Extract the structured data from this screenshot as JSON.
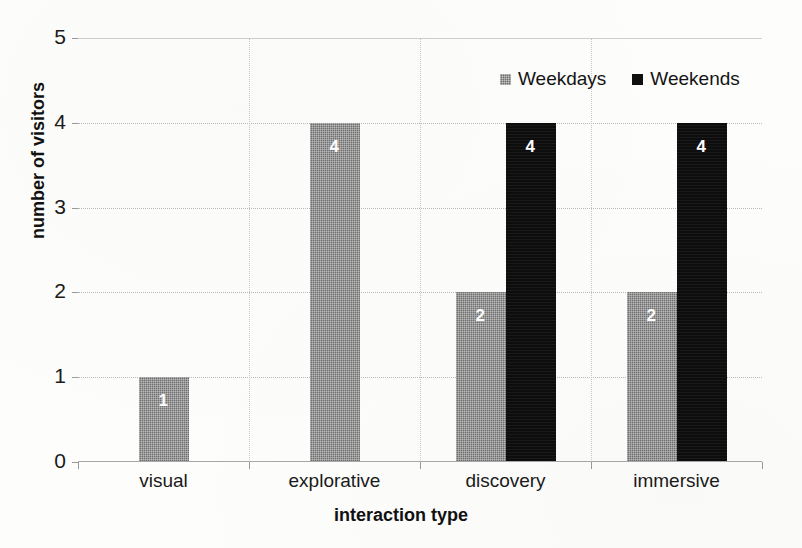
{
  "chart_data": {
    "type": "bar",
    "title": "",
    "xlabel": "interaction type",
    "ylabel": "number of visitors",
    "categories": [
      "visual",
      "explorative",
      "discovery",
      "immersive"
    ],
    "series": [
      {
        "name": "Weekdays",
        "color": "#6f6f6f",
        "values": [
          1,
          4,
          2,
          2
        ]
      },
      {
        "name": "Weekends",
        "color": "#0d0d0d",
        "values": [
          0,
          0,
          4,
          4
        ]
      }
    ],
    "ylim": [
      0,
      5
    ],
    "yticks": [
      0,
      1,
      2,
      3,
      4,
      5
    ],
    "ytick_labels": [
      "0",
      "1",
      "2",
      "3",
      "4",
      "5"
    ],
    "grid": true,
    "legend_position": "top-right",
    "data_labels": {
      "visual": {
        "Weekdays": "1"
      },
      "explorative": {
        "Weekdays": "4"
      },
      "discovery": {
        "Weekdays": "2",
        "Weekends": "4"
      },
      "immersive": {
        "Weekdays": "2",
        "Weekends": "4"
      }
    }
  },
  "legend": {
    "items": [
      {
        "label": "Weekdays",
        "swatch": "gray-square-icon"
      },
      {
        "label": "Weekends",
        "swatch": "black-square-icon"
      }
    ]
  },
  "axes": {
    "y_title": "number of visitors",
    "x_title": "interaction type",
    "y_ticks": [
      "0",
      "1",
      "2",
      "3",
      "4",
      "5"
    ],
    "x_ticks": [
      "visual",
      "explorative",
      "discovery",
      "immersive"
    ]
  },
  "bars": [
    {
      "category": "visual",
      "series": "Weekdays",
      "value": 1,
      "label": "1"
    },
    {
      "category": "explorative",
      "series": "Weekdays",
      "value": 4,
      "label": "4"
    },
    {
      "category": "discovery",
      "series": "Weekdays",
      "value": 2,
      "label": "2"
    },
    {
      "category": "discovery",
      "series": "Weekends",
      "value": 4,
      "label": "4"
    },
    {
      "category": "immersive",
      "series": "Weekdays",
      "value": 2,
      "label": "2"
    },
    {
      "category": "immersive",
      "series": "Weekends",
      "value": 4,
      "label": "4"
    }
  ]
}
